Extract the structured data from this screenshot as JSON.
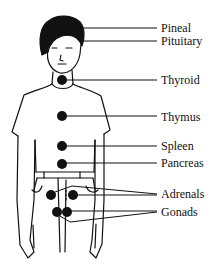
{
  "diagram": {
    "colors": {
      "ink": "#111111",
      "background": "#ffffff"
    },
    "labels": [
      {
        "id": "pineal",
        "text": "Pineal",
        "y": 22
      },
      {
        "id": "pituitary",
        "text": "Pituitary",
        "y": 35
      },
      {
        "id": "thyroid",
        "text": "Thyroid",
        "y": 74
      },
      {
        "id": "thymus",
        "text": "Thymus",
        "y": 111
      },
      {
        "id": "spleen",
        "text": "Spleen",
        "y": 140
      },
      {
        "id": "pancreas",
        "text": "Pancreas",
        "y": 157
      },
      {
        "id": "adrenals",
        "text": "Adrenals",
        "y": 188
      },
      {
        "id": "gonads",
        "text": "Gonads",
        "y": 206
      }
    ]
  }
}
